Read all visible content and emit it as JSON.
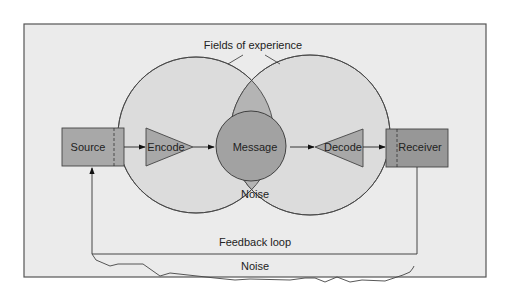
{
  "diagram": {
    "title": "Fields of experience",
    "nodes": {
      "source": "Source",
      "encode": "Encode",
      "message": "Message",
      "noise_center": "Noise",
      "decode": "Decode",
      "receiver": "Receiver"
    },
    "feedback_label": "Feedback loop",
    "noise_bottom": "Noise"
  },
  "colors": {
    "background": "#ebebeb",
    "frame": "#555555",
    "field_fill": "#dcdcdc",
    "overlap_fill": "#b4b4b4",
    "message_fill": "#a2a2a2",
    "box_fill": "#a8a8a8",
    "receiver_fill": "#979797"
  }
}
